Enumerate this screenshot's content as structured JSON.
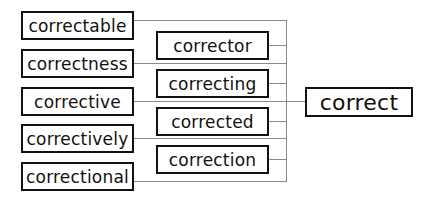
{
  "diagram": {
    "root": {
      "label": "correct"
    },
    "left_column": [
      {
        "label": "correctable"
      },
      {
        "label": "correctness"
      },
      {
        "label": "corrective"
      },
      {
        "label": "correctively"
      },
      {
        "label": "correctional"
      }
    ],
    "middle_column": [
      {
        "label": "corrector"
      },
      {
        "label": "correcting"
      },
      {
        "label": "corrected"
      },
      {
        "label": "correction"
      }
    ],
    "colors": {
      "box_border": "#111111",
      "connector": "#8a8a8a",
      "background": "#ffffff"
    }
  }
}
